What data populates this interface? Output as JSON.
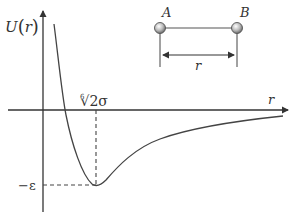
{
  "diagram": {
    "y_axis_label": "U(r)",
    "y_axis_label_parts": {
      "func": "U",
      "open": "(",
      "var": "r",
      "close": ")"
    },
    "x_axis_label": "r",
    "zero_crossing_label": "∜2σ",
    "zero_crossing_label_parts": {
      "root_index": "6",
      "radical": "√",
      "body": "2σ"
    },
    "min_value_label": "−ε",
    "inset": {
      "atom_a_label": "A",
      "atom_b_label": "B",
      "separation_label": "r"
    },
    "colors": {
      "axis": "#333333",
      "curve": "#444444",
      "dashed": "#444444",
      "atom_fill": "#b5b5b5",
      "atom_stroke": "#555555"
    }
  }
}
